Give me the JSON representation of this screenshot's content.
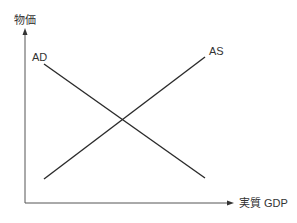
{
  "diagram": {
    "type": "AD-AS model",
    "y_axis_label": "物価",
    "x_axis_label": "実質 GDP",
    "curves": [
      {
        "name": "AD",
        "label": "AD",
        "slope": "downward"
      },
      {
        "name": "AS",
        "label": "AS",
        "slope": "upward"
      }
    ],
    "colors": {
      "line": "#2b2b2b",
      "axis": "#555555",
      "text": "#333333"
    }
  }
}
